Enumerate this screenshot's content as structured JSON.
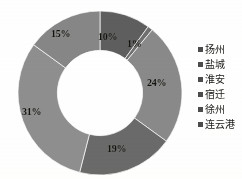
{
  "chart_data": {
    "type": "pie",
    "variant": "donut",
    "title": "",
    "subtitle": "",
    "xlabel": "",
    "ylabel": "",
    "grid": false,
    "legend_position": "right",
    "start_angle_deg": 0,
    "direction": "clockwise",
    "hole_ratio": 0.52,
    "categories": [
      "扬州",
      "盐城",
      "淮安",
      "宿迁",
      "徐州",
      "连云港"
    ],
    "values": [
      10,
      1,
      24,
      19,
      31,
      15
    ],
    "value_unit": "%",
    "data_labels": [
      "10%",
      "1%",
      "24%",
      "19%",
      "31%",
      "15%"
    ],
    "slice_colors": [
      "#5e5e5e",
      "#6f6f6f",
      "#8a8a8a",
      "#6a6a6a",
      "#8f8f8f",
      "#878787"
    ],
    "slices": [
      {
        "name": "扬州",
        "value": 10,
        "label": "10%",
        "color": "#5e5e5e"
      },
      {
        "name": "盐城",
        "value": 1,
        "label": "1%",
        "color": "#6f6f6f"
      },
      {
        "name": "淮安",
        "value": 24,
        "label": "24%",
        "color": "#8a8a8a"
      },
      {
        "name": "宿迁",
        "value": 19,
        "label": "19%",
        "color": "#6a6a6a"
      },
      {
        "name": "徐州",
        "value": 31,
        "label": "31%",
        "color": "#8f8f8f"
      },
      {
        "name": "连云港",
        "value": 15,
        "label": "15%",
        "color": "#878787"
      }
    ]
  },
  "legend": {
    "items": [
      {
        "label": "扬州",
        "swatch_color": "#4c4c4c"
      },
      {
        "label": "盐城",
        "swatch_color": "#4c4c4c"
      },
      {
        "label": "淮安",
        "swatch_color": "#4c4c4c"
      },
      {
        "label": "宿迁",
        "swatch_color": "#4c4c4c"
      },
      {
        "label": "徐州",
        "swatch_color": "#4c4c4c"
      },
      {
        "label": "连云港",
        "swatch_color": "#4c4c4c"
      }
    ]
  },
  "labels": {
    "yangzhou": "10%",
    "yancheng": "1%",
    "huaian": "24%",
    "suqian": "19%",
    "xuzhou": "31%",
    "lianyungang": "15%"
  }
}
